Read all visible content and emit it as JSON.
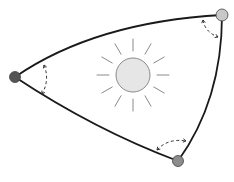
{
  "diagram": {
    "colors": {
      "background": "#ffffff",
      "edge": "#1a1a1a",
      "angle_arc": "#333333",
      "sun_fill": "#e6e6e6",
      "sun_stroke": "#8a8a8a",
      "ray": "#8a8a8a",
      "vertex_stroke": "#444444"
    },
    "vertices": [
      {
        "id": "left",
        "x": 15,
        "y": 77,
        "r": 5.5,
        "fill": "#555555"
      },
      {
        "id": "top-right",
        "x": 222,
        "y": 15,
        "r": 6,
        "fill": "#c8c8c8"
      },
      {
        "id": "bottom",
        "x": 178,
        "y": 161,
        "r": 5.5,
        "fill": "#8c8c8c"
      }
    ],
    "edges": [
      {
        "id": "top-edge",
        "d": "M15,77 Q95,22 222,15"
      },
      {
        "id": "right-edge",
        "d": "M222,15 Q222,100 178,161"
      },
      {
        "id": "bottom-edge",
        "d": "M15,77 Q95,130 178,161"
      }
    ],
    "angle_arcs": [
      {
        "id": "left-angle",
        "d": "M44,65 Q50,80 42,94"
      },
      {
        "id": "top-right-angle",
        "d": "M203,20 Q205,32 218,37"
      },
      {
        "id": "bottom-angle",
        "d": "M157,150 Q168,138 186,141"
      }
    ],
    "sun": {
      "cx": 133,
      "cy": 75,
      "r": 17,
      "ray_count": 12,
      "ray_inner": 24,
      "ray_outer": 36,
      "ray_start_angle_deg": 0
    }
  }
}
